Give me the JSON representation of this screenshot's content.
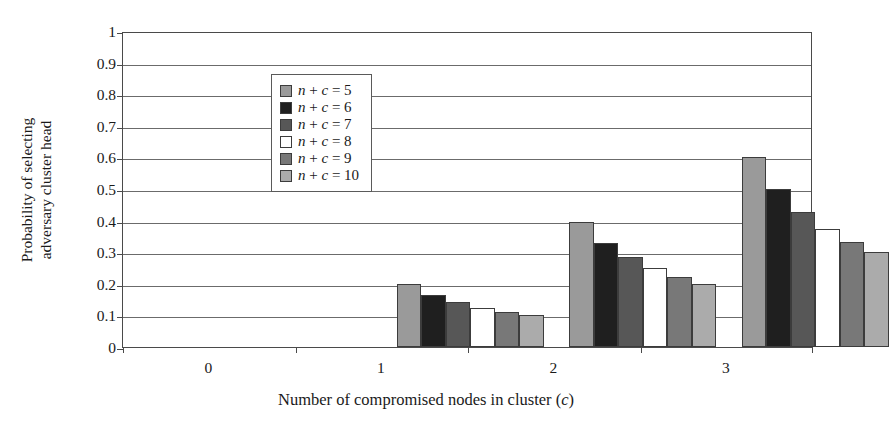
{
  "chart_data": {
    "type": "bar",
    "title": "",
    "xlabel": "Number of compromised nodes in cluster (c)",
    "xlabel_parts": {
      "main": "Number of compromised nodes in cluster (",
      "italic": "c",
      "tail": ")"
    },
    "ylabel": "Probability of selecting adversary cluster head",
    "ylabel_lines": [
      "Probability of selecting",
      "adversary cluster head"
    ],
    "categories": [
      "0",
      "1",
      "2",
      "3"
    ],
    "xlim_note": "categorical, 4 groups",
    "ylim": [
      0,
      1
    ],
    "yticks": [
      "0",
      "0.1",
      "0.2",
      "0.3",
      "0.4",
      "0.5",
      "0.6",
      "0.7",
      "0.8",
      "0.9",
      "1"
    ],
    "ytick_values": [
      0,
      0.1,
      0.2,
      0.3,
      0.4,
      0.5,
      0.6,
      0.7,
      0.8,
      0.9,
      1
    ],
    "grid": true,
    "grid_axis": "y",
    "legend_position": "top-left inside",
    "series": [
      {
        "name": "n + c = 5",
        "legend_label_parts": {
          "n": "n",
          "plus": " + ",
          "c": "c",
          "eq": " = ",
          "val": "5"
        },
        "color": "#9a9a9a",
        "values": [
          0,
          0.2,
          0.395,
          0.6
        ]
      },
      {
        "name": "n + c = 6",
        "legend_label_parts": {
          "n": "n",
          "plus": " + ",
          "c": "c",
          "eq": " = ",
          "val": "6"
        },
        "color": "#1f1f1f",
        "values": [
          0,
          0.165,
          0.33,
          0.5
        ]
      },
      {
        "name": "n + c = 7",
        "legend_label_parts": {
          "n": "n",
          "plus": " + ",
          "c": "c",
          "eq": " = ",
          "val": "7"
        },
        "color": "#575757",
        "values": [
          0,
          0.142,
          0.285,
          0.428
        ]
      },
      {
        "name": "n + c = 8",
        "legend_label_parts": {
          "n": "n",
          "plus": " + ",
          "c": "c",
          "eq": " = ",
          "val": "8"
        },
        "color": "#ffffff",
        "values": [
          0,
          0.125,
          0.25,
          0.375
        ]
      },
      {
        "name": "n + c = 9",
        "legend_label_parts": {
          "n": "n",
          "plus": " + ",
          "c": "c",
          "eq": " = ",
          "val": "9"
        },
        "color": "#787878",
        "values": [
          0,
          0.111,
          0.222,
          0.333
        ]
      },
      {
        "name": "n + c = 10",
        "legend_label_parts": {
          "n": "n",
          "plus": " + ",
          "c": "c",
          "eq": " = ",
          "val": "10"
        },
        "color": "#ababab",
        "values": [
          0,
          0.1,
          0.2,
          0.3
        ]
      }
    ]
  },
  "style": {
    "axis_color": "#4a4a4a",
    "grid_color": "#6b6b6b",
    "bar_edge_color": "#3c3c3c",
    "background": "#ffffff",
    "text_color": "#1a1a1a"
  }
}
